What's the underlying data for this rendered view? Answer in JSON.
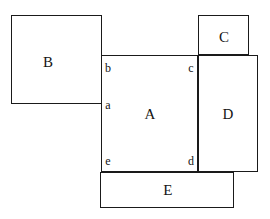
{
  "figure": {
    "canvas": {
      "width": 270,
      "height": 219
    },
    "background_color": "#ffffff",
    "stroke_color": "#1a1a1a",
    "fill_color": "#ffffff"
  },
  "rectangles": [
    {
      "id": "B",
      "label": "B",
      "x": 11,
      "y": 15,
      "width": 91,
      "height": 89,
      "label_x": 48,
      "label_y": 62
    },
    {
      "id": "C",
      "label": "C",
      "x": 198,
      "y": 15,
      "width": 51,
      "height": 40,
      "label_x": 224,
      "label_y": 37
    },
    {
      "id": "A",
      "label": "A",
      "x": 101,
      "y": 55,
      "width": 97,
      "height": 117,
      "label_x": 150,
      "label_y": 114
    },
    {
      "id": "D",
      "label": "D",
      "x": 198,
      "y": 55,
      "width": 60,
      "height": 117,
      "label_x": 228,
      "label_y": 114
    },
    {
      "id": "E",
      "label": "E",
      "x": 100,
      "y": 172,
      "width": 134,
      "height": 36,
      "label_x": 168,
      "label_y": 190
    }
  ],
  "vertices": [
    {
      "id": "b",
      "label": "b",
      "x": 108,
      "y": 68
    },
    {
      "id": "c",
      "label": "c",
      "x": 191,
      "y": 68
    },
    {
      "id": "a",
      "label": "a",
      "x": 108,
      "y": 105
    },
    {
      "id": "e",
      "label": "e",
      "x": 108,
      "y": 161
    },
    {
      "id": "d",
      "label": "d",
      "x": 191,
      "y": 161
    }
  ]
}
